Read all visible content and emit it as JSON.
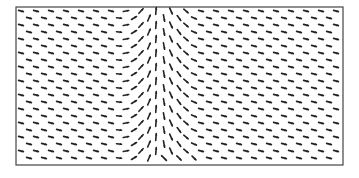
{
  "chart_data": {
    "type": "quiver",
    "title": "",
    "xlabel": "",
    "ylabel": "",
    "grid": false,
    "legend": null,
    "frame": {
      "x": 16,
      "y": 7,
      "width": 327,
      "height": 158,
      "stroke": "#444444"
    },
    "grid_layout": {
      "columns": 22,
      "rows": 22,
      "x_start": 21,
      "x_step": 15,
      "y_start": 11,
      "y_step": 7,
      "odd_row_x_offset": 8
    },
    "vector_field": {
      "description": "Short mostly-horizontal arrows pointing right across the domain; in a central vertical band (approx x 115–200 px) arrows turn vertical, pointing up on the left half of the band and down on the right half, with slanted arrows at the bottom center.",
      "band_center_x": 158,
      "band_half_width": 42,
      "base_angle_deg": 15,
      "arrow_length": 5,
      "color": "#222222"
    }
  }
}
